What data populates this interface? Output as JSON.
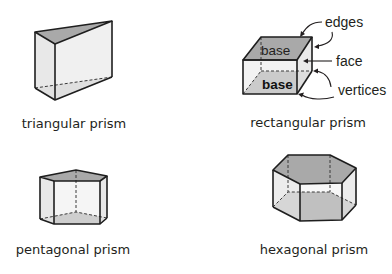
{
  "colors": {
    "base_fill": "#a9a9a9",
    "side_fill": "#e6e6e6",
    "side_fill_light": "#eeeeee",
    "edge": "#1e1e1e",
    "text": "#231f20"
  },
  "shapes": [
    {
      "id": "triangular",
      "label": "triangular prism"
    },
    {
      "id": "rectangular",
      "label": "rectangular prism"
    },
    {
      "id": "pentagonal",
      "label": "pentagonal prism"
    },
    {
      "id": "hexagonal",
      "label": "hexagonal prism"
    }
  ],
  "rectangular_annotations": {
    "top_face_label": "base",
    "bottom_face_label": "base",
    "edges_label": "edges",
    "face_label": "face",
    "vertices_label": "vertices"
  }
}
